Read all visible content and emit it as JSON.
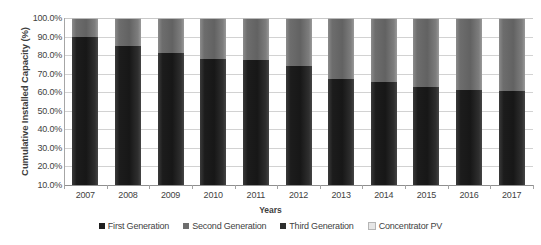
{
  "chart_data": {
    "type": "bar",
    "subtype": "stacked-100-percent",
    "title": "",
    "xlabel": "Years",
    "ylabel": "Cumulative Installed Capacity (%)",
    "categories": [
      "2007",
      "2008",
      "2009",
      "2010",
      "2011",
      "2012",
      "2013",
      "2014",
      "2015",
      "2016",
      "2017"
    ],
    "ylim": [
      10,
      100
    ],
    "yticks": [
      "100.0%",
      "90.0%",
      "80.0%",
      "70.0%",
      "60.0%",
      "50.0%",
      "40.0%",
      "30.0%",
      "20.0%",
      "10.0%"
    ],
    "ytick_values": [
      100,
      90,
      80,
      70,
      60,
      50,
      40,
      30,
      20,
      10
    ],
    "grid": true,
    "legend_position": "bottom",
    "series": [
      {
        "name": "First Generation",
        "color": "#1f1f1f",
        "values": [
          90.0,
          85.0,
          81.0,
          78.0,
          77.5,
          74.0,
          67.0,
          65.5,
          63.0,
          61.0,
          60.5
        ]
      },
      {
        "name": "Second Generation",
        "color": "#6e6e6e",
        "values": [
          9.3,
          14.3,
          18.3,
          21.3,
          21.8,
          25.3,
          32.3,
          33.8,
          36.3,
          38.3,
          38.8
        ]
      },
      {
        "name": "Third Generation",
        "color": "#3a3a3a",
        "values": [
          0.0,
          0.0,
          0.0,
          0.0,
          0.0,
          0.0,
          0.0,
          0.0,
          0.0,
          0.0,
          0.0
        ]
      },
      {
        "name": "Concentrator PV",
        "color": "#e6e6e6",
        "values": [
          0.7,
          0.7,
          0.7,
          0.7,
          0.7,
          0.7,
          0.7,
          0.7,
          0.7,
          0.7,
          0.7
        ]
      }
    ]
  },
  "legend": {
    "items": [
      {
        "label": "First Generation",
        "color": "#1f1f1f"
      },
      {
        "label": "Second Generation",
        "color": "#6e6e6e"
      },
      {
        "label": "Third Generation",
        "color": "#2f2f2f"
      },
      {
        "label": "Concentrator PV",
        "color": "#e6e6e6"
      }
    ]
  }
}
